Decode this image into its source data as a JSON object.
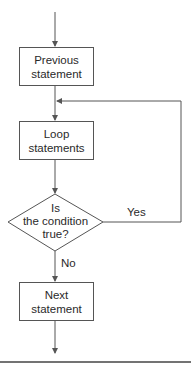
{
  "diagram": {
    "type": "flowchart",
    "nodes": {
      "previous": {
        "line1": "Previous",
        "line2": "statement"
      },
      "loop": {
        "line1": "Loop",
        "line2": "statements"
      },
      "condition": {
        "line1": "Is",
        "line2": "the condition",
        "line3": "true?"
      },
      "next": {
        "line1": "Next",
        "line2": "statement"
      }
    },
    "edges": {
      "yes_label": "Yes",
      "no_label": "No"
    },
    "colors": {
      "line": "#555555",
      "text": "#2a2a2a",
      "background": "#ffffff"
    }
  }
}
